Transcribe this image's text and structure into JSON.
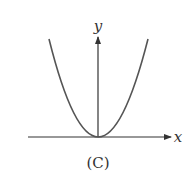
{
  "figure": {
    "caption": "(C)",
    "x_axis_label": "x",
    "y_axis_label": "y",
    "curve": "parabola y = k·x², vertex at origin, opening upward",
    "colors": {
      "axes": "#333333",
      "curve": "#555555",
      "text": "#333333"
    }
  }
}
